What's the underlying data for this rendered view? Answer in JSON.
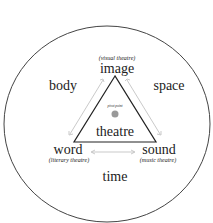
{
  "diagram": {
    "outer": {
      "body": "body",
      "space": "space",
      "time": "time"
    },
    "vertices": {
      "image": {
        "label": "image",
        "sub": "(visual theatre)"
      },
      "word": {
        "label": "word",
        "sub": "(literary theatre)"
      },
      "sound": {
        "label": "sound",
        "sub": "(music theatre)"
      }
    },
    "center": {
      "label": "theatre",
      "pivot": "pivot point"
    },
    "colors": {
      "line": "#333333",
      "arrow": "#bbbbbb",
      "dot": "#999999"
    }
  }
}
